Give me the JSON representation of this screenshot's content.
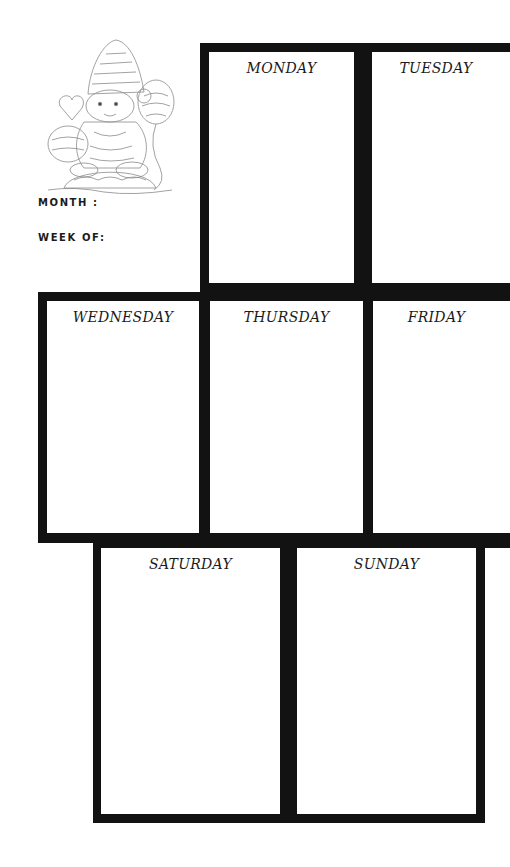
{
  "page": {
    "type": "weekly-planner-printable",
    "background_color": "#ffffff",
    "frame_color": "#121212"
  },
  "header": {
    "illustration": "zentangle-bear-with-santa-hat-and-balloons",
    "month_label": "MONTH :",
    "week_label": "WEEK OF:",
    "month_value": "",
    "week_value": ""
  },
  "days": [
    {
      "label": "MONDAY",
      "notes": ""
    },
    {
      "label": "TUESDAY",
      "notes": ""
    },
    {
      "label": "WEDNESDAY",
      "notes": ""
    },
    {
      "label": "THURSDAY",
      "notes": ""
    },
    {
      "label": "FRIDAY",
      "notes": ""
    },
    {
      "label": "SATURDAY",
      "notes": ""
    },
    {
      "label": "SUNDAY",
      "notes": ""
    }
  ]
}
